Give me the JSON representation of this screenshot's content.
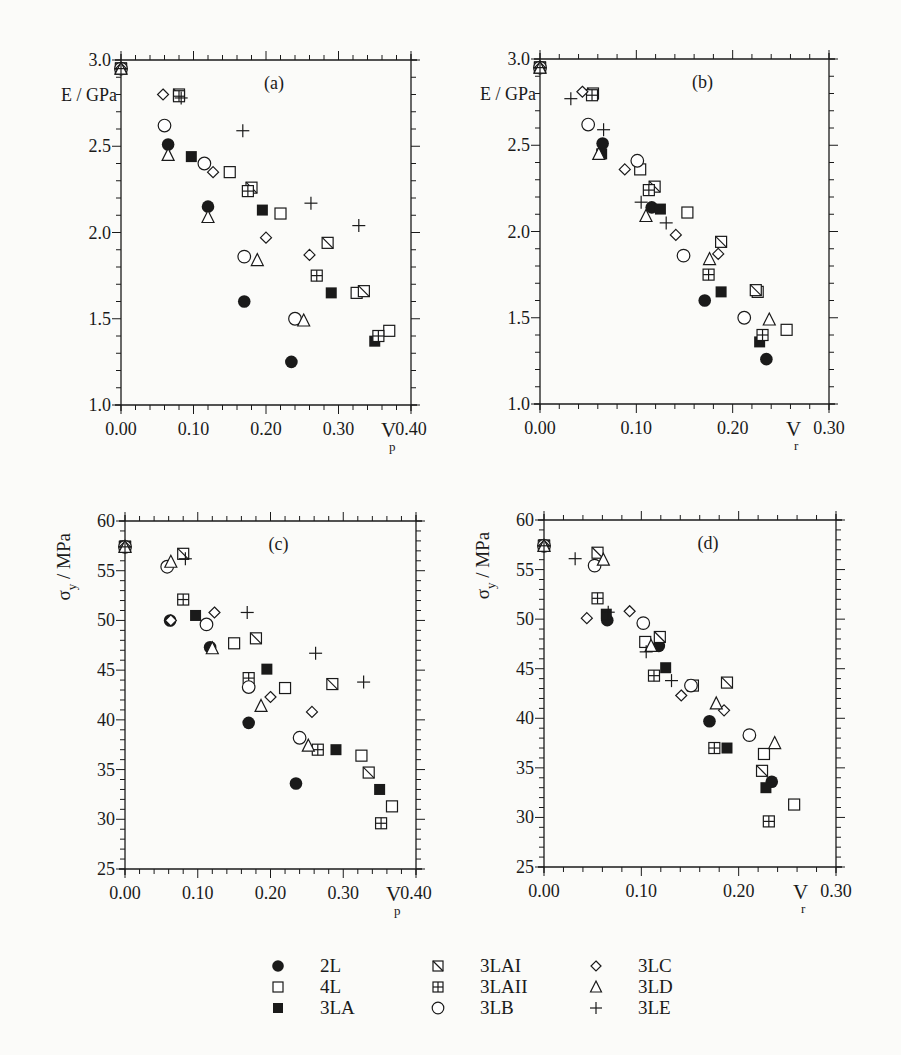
{
  "figure": {
    "background": "#fbfbf9",
    "ink": "#1a1a1a"
  },
  "legend": {
    "columns": [
      [
        {
          "key": "2L",
          "label": "2L",
          "marker": "filled-circle"
        },
        {
          "key": "4L",
          "label": "4L",
          "marker": "open-square"
        },
        {
          "key": "3LA",
          "label": "3LA",
          "marker": "filled-square"
        }
      ],
      [
        {
          "key": "3LAI",
          "label": "3LAI",
          "marker": "diag-square"
        },
        {
          "key": "3LAII",
          "label": "3LAII",
          "marker": "cross-square"
        },
        {
          "key": "3LB",
          "label": "3LB",
          "marker": "open-circle"
        }
      ],
      [
        {
          "key": "3LC",
          "label": "3LC",
          "marker": "open-diamond"
        },
        {
          "key": "3LD",
          "label": "3LD",
          "marker": "open-triangle"
        },
        {
          "key": "3LE",
          "label": "3LE",
          "marker": "plus"
        }
      ]
    ]
  },
  "chart_data": [
    {
      "id": "a",
      "panel_label": "(a)",
      "type": "scatter",
      "xlabel": "V",
      "xlabel_sub": "p",
      "ylabel": "E / GPa",
      "xlim": [
        0.0,
        0.4
      ],
      "ylim": [
        1.0,
        3.0
      ],
      "xticks": [
        "0.00",
        "0.10",
        "0.20",
        "0.30",
        "0.40"
      ],
      "yticks": [
        "1.0",
        "1.5",
        "2.0",
        "2.5",
        "3.0"
      ],
      "grid": false,
      "frame": {
        "left": 121,
        "right": 411,
        "top": 60,
        "bottom": 405
      },
      "series": [
        {
          "name": "2L",
          "points": [
            [
              0.0,
              2.95
            ],
            [
              0.065,
              2.51
            ],
            [
              0.12,
              2.15
            ],
            [
              0.17,
              1.6
            ],
            [
              0.235,
              1.25
            ]
          ]
        },
        {
          "name": "4L",
          "points": [
            [
              0.0,
              2.95
            ],
            [
              0.15,
              2.35
            ],
            [
              0.22,
              2.11
            ],
            [
              0.325,
              1.65
            ],
            [
              0.37,
              1.43
            ]
          ]
        },
        {
          "name": "3LA",
          "points": [
            [
              0.0,
              2.95
            ],
            [
              0.097,
              2.44
            ],
            [
              0.195,
              2.13
            ],
            [
              0.29,
              1.65
            ],
            [
              0.35,
              1.37
            ]
          ]
        },
        {
          "name": "3LAI",
          "points": [
            [
              0.0,
              2.95
            ],
            [
              0.08,
              2.8
            ],
            [
              0.18,
              2.26
            ],
            [
              0.285,
              1.94
            ],
            [
              0.335,
              1.66
            ]
          ]
        },
        {
          "name": "3LAII",
          "points": [
            [
              0.0,
              2.95
            ],
            [
              0.08,
              2.79
            ],
            [
              0.175,
              2.24
            ],
            [
              0.27,
              1.75
            ],
            [
              0.355,
              1.4
            ]
          ]
        },
        {
          "name": "3LB",
          "points": [
            [
              0.0,
              2.95
            ],
            [
              0.06,
              2.62
            ],
            [
              0.115,
              2.4
            ],
            [
              0.17,
              1.86
            ],
            [
              0.24,
              1.5
            ]
          ]
        },
        {
          "name": "3LC",
          "points": [
            [
              0.0,
              2.95
            ],
            [
              0.058,
              2.8
            ],
            [
              0.127,
              2.35
            ],
            [
              0.2,
              1.97
            ],
            [
              0.26,
              1.87
            ]
          ]
        },
        {
          "name": "3LD",
          "points": [
            [
              0.0,
              2.95
            ],
            [
              0.065,
              2.45
            ],
            [
              0.12,
              2.09
            ],
            [
              0.188,
              1.84
            ],
            [
              0.252,
              1.49
            ]
          ]
        },
        {
          "name": "3LE",
          "points": [
            [
              0.0,
              2.95
            ],
            [
              0.083,
              2.78
            ],
            [
              0.168,
              2.59
            ],
            [
              0.262,
              2.17
            ],
            [
              0.328,
              2.04
            ]
          ]
        }
      ]
    },
    {
      "id": "b",
      "panel_label": "(b)",
      "type": "scatter",
      "xlabel": "V",
      "xlabel_sub": "r",
      "ylabel": "E / GPa",
      "xlim": [
        0.0,
        0.3
      ],
      "ylim": [
        1.0,
        3.0
      ],
      "xticks": [
        "0.00",
        "0.10",
        "0.20",
        "0.30"
      ],
      "yticks": [
        "1.0",
        "1.5",
        "2.0",
        "2.5",
        "3.0"
      ],
      "grid": false,
      "frame": {
        "left": 540,
        "right": 829,
        "top": 59,
        "bottom": 404
      },
      "series": [
        {
          "name": "2L",
          "points": [
            [
              0.0,
              2.95
            ],
            [
              0.065,
              2.51
            ],
            [
              0.116,
              2.14
            ],
            [
              0.171,
              1.6
            ],
            [
              0.235,
              1.26
            ]
          ]
        },
        {
          "name": "4L",
          "points": [
            [
              0.0,
              2.95
            ],
            [
              0.104,
              2.36
            ],
            [
              0.153,
              2.11
            ],
            [
              0.226,
              1.65
            ],
            [
              0.256,
              1.43
            ]
          ]
        },
        {
          "name": "3LA",
          "points": [
            [
              0.0,
              2.95
            ],
            [
              0.064,
              2.45
            ],
            [
              0.125,
              2.13
            ],
            [
              0.188,
              1.65
            ],
            [
              0.228,
              1.36
            ]
          ]
        },
        {
          "name": "3LAI",
          "points": [
            [
              0.0,
              2.95
            ],
            [
              0.055,
              2.8
            ],
            [
              0.119,
              2.26
            ],
            [
              0.188,
              1.94
            ],
            [
              0.224,
              1.66
            ]
          ]
        },
        {
          "name": "3LAII",
          "points": [
            [
              0.0,
              2.95
            ],
            [
              0.054,
              2.79
            ],
            [
              0.113,
              2.24
            ],
            [
              0.175,
              1.75
            ],
            [
              0.231,
              1.4
            ]
          ]
        },
        {
          "name": "3LB",
          "points": [
            [
              0.0,
              2.95
            ],
            [
              0.05,
              2.62
            ],
            [
              0.101,
              2.41
            ],
            [
              0.149,
              1.86
            ],
            [
              0.212,
              1.5
            ]
          ]
        },
        {
          "name": "3LC",
          "points": [
            [
              0.0,
              2.95
            ],
            [
              0.044,
              2.81
            ],
            [
              0.088,
              2.36
            ],
            [
              0.141,
              1.98
            ],
            [
              0.185,
              1.87
            ]
          ]
        },
        {
          "name": "3LD",
          "points": [
            [
              0.0,
              2.95
            ],
            [
              0.061,
              2.45
            ],
            [
              0.11,
              2.09
            ],
            [
              0.176,
              1.84
            ],
            [
              0.238,
              1.49
            ]
          ]
        },
        {
          "name": "3LE",
          "points": [
            [
              0.0,
              2.95
            ],
            [
              0.032,
              2.77
            ],
            [
              0.066,
              2.59
            ],
            [
              0.105,
              2.17
            ],
            [
              0.131,
              2.05
            ]
          ]
        }
      ]
    },
    {
      "id": "c",
      "panel_label": "(c)",
      "type": "scatter",
      "xlabel": "V",
      "xlabel_sub": "p",
      "ylabel": "σ",
      "ylabel_sub": "y",
      "ylabel_unit": " / MPa",
      "xlim": [
        0.0,
        0.4
      ],
      "ylim": [
        25,
        60
      ],
      "xticks": [
        "0.00",
        "0.10",
        "0.20",
        "0.30",
        "0.40"
      ],
      "yticks": [
        "25",
        "30",
        "35",
        "40",
        "45",
        "50",
        "55",
        "60"
      ],
      "grid": false,
      "frame": {
        "left": 125,
        "right": 416,
        "top": 521,
        "bottom": 869
      },
      "series": [
        {
          "name": "2L",
          "points": [
            [
              0.0,
              57.4
            ],
            [
              0.062,
              50.0
            ],
            [
              0.117,
              47.3
            ],
            [
              0.17,
              39.7
            ],
            [
              0.235,
              33.6
            ]
          ]
        },
        {
          "name": "4L",
          "points": [
            [
              0.0,
              57.4
            ],
            [
              0.15,
              47.7
            ],
            [
              0.22,
              43.2
            ],
            [
              0.325,
              36.4
            ],
            [
              0.367,
              31.3
            ]
          ]
        },
        {
          "name": "3LA",
          "points": [
            [
              0.0,
              57.4
            ],
            [
              0.097,
              50.5
            ],
            [
              0.195,
              45.1
            ],
            [
              0.29,
              37.0
            ],
            [
              0.35,
              33.0
            ]
          ]
        },
        {
          "name": "3LAI",
          "points": [
            [
              0.0,
              57.4
            ],
            [
              0.08,
              56.7
            ],
            [
              0.18,
              48.2
            ],
            [
              0.285,
              43.6
            ],
            [
              0.335,
              34.7
            ]
          ]
        },
        {
          "name": "3LAII",
          "points": [
            [
              0.0,
              57.4
            ],
            [
              0.08,
              52.1
            ],
            [
              0.17,
              44.2
            ],
            [
              0.265,
              37.0
            ],
            [
              0.352,
              29.6
            ]
          ]
        },
        {
          "name": "3LB",
          "points": [
            [
              0.0,
              57.4
            ],
            [
              0.058,
              55.4
            ],
            [
              0.112,
              49.6
            ],
            [
              0.17,
              43.3
            ],
            [
              0.24,
              38.2
            ]
          ]
        },
        {
          "name": "3LC",
          "points": [
            [
              0.0,
              57.4
            ],
            [
              0.063,
              50.0
            ],
            [
              0.123,
              50.8
            ],
            [
              0.2,
              42.3
            ],
            [
              0.257,
              40.8
            ]
          ]
        },
        {
          "name": "3LD",
          "points": [
            [
              0.0,
              57.4
            ],
            [
              0.063,
              55.9
            ],
            [
              0.12,
              47.2
            ],
            [
              0.187,
              41.4
            ],
            [
              0.252,
              37.4
            ]
          ]
        },
        {
          "name": "3LE",
          "points": [
            [
              0.0,
              57.4
            ],
            [
              0.083,
              56.2
            ],
            [
              0.168,
              50.8
            ],
            [
              0.262,
              46.7
            ],
            [
              0.328,
              43.8
            ]
          ]
        }
      ]
    },
    {
      "id": "d",
      "panel_label": "(d)",
      "type": "scatter",
      "xlabel": "V",
      "xlabel_sub": "r",
      "ylabel": "σ",
      "ylabel_sub": "y",
      "ylabel_unit": " / MPa",
      "xlim": [
        0.0,
        0.3
      ],
      "ylim": [
        25,
        60
      ],
      "xticks": [
        "0.00",
        "0.10",
        "0.20",
        "0.30"
      ],
      "yticks": [
        "25",
        "30",
        "35",
        "40",
        "45",
        "50",
        "55",
        "60"
      ],
      "grid": false,
      "frame": {
        "left": 544,
        "right": 836,
        "top": 520,
        "bottom": 867
      },
      "series": [
        {
          "name": "2L",
          "points": [
            [
              0.0,
              57.4
            ],
            [
              0.065,
              49.9
            ],
            [
              0.118,
              47.3
            ],
            [
              0.17,
              39.7
            ],
            [
              0.234,
              33.6
            ]
          ]
        },
        {
          "name": "4L",
          "points": [
            [
              0.0,
              57.4
            ],
            [
              0.104,
              47.7
            ],
            [
              0.153,
              43.3
            ],
            [
              0.226,
              36.4
            ],
            [
              0.257,
              31.3
            ]
          ]
        },
        {
          "name": "3LA",
          "points": [
            [
              0.0,
              57.4
            ],
            [
              0.064,
              50.5
            ],
            [
              0.125,
              45.1
            ],
            [
              0.188,
              37.0
            ],
            [
              0.228,
              33.0
            ]
          ]
        },
        {
          "name": "3LAI",
          "points": [
            [
              0.0,
              57.4
            ],
            [
              0.055,
              56.7
            ],
            [
              0.119,
              48.2
            ],
            [
              0.188,
              43.6
            ],
            [
              0.224,
              34.7
            ]
          ]
        },
        {
          "name": "3LAII",
          "points": [
            [
              0.0,
              57.4
            ],
            [
              0.055,
              52.1
            ],
            [
              0.113,
              44.3
            ],
            [
              0.175,
              37.0
            ],
            [
              0.231,
              29.6
            ]
          ]
        },
        {
          "name": "3LB",
          "points": [
            [
              0.0,
              57.4
            ],
            [
              0.052,
              55.4
            ],
            [
              0.102,
              49.6
            ],
            [
              0.151,
              43.3
            ],
            [
              0.211,
              38.3
            ]
          ]
        },
        {
          "name": "3LC",
          "points": [
            [
              0.0,
              57.4
            ],
            [
              0.044,
              50.1
            ],
            [
              0.088,
              50.8
            ],
            [
              0.141,
              42.3
            ],
            [
              0.185,
              40.8
            ]
          ]
        },
        {
          "name": "3LD",
          "points": [
            [
              0.0,
              57.4
            ],
            [
              0.061,
              56.0
            ],
            [
              0.11,
              47.3
            ],
            [
              0.177,
              41.5
            ],
            [
              0.237,
              37.5
            ]
          ]
        },
        {
          "name": "3LE",
          "points": [
            [
              0.0,
              57.4
            ],
            [
              0.032,
              56.1
            ],
            [
              0.066,
              50.7
            ],
            [
              0.105,
              46.7
            ],
            [
              0.131,
              43.8
            ]
          ]
        }
      ]
    }
  ]
}
